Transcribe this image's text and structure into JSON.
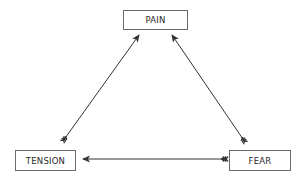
{
  "diagram": {
    "type": "cycle",
    "nodes": [
      {
        "id": "pain",
        "label": "PAIN"
      },
      {
        "id": "tension",
        "label": "TENSION"
      },
      {
        "id": "fear",
        "label": "FEAR"
      }
    ],
    "edges": [
      {
        "from": "tension",
        "to": "pain",
        "style": "fletched-arrow"
      },
      {
        "from": "fear",
        "to": "pain",
        "style": "fletched-arrow"
      },
      {
        "from": "fear",
        "to": "tension",
        "style": "fletched-arrow"
      }
    ],
    "colors": {
      "line": "#333333",
      "box_border": "#6a6a6a",
      "text": "#2a2a2a",
      "background": "#ffffff"
    }
  }
}
